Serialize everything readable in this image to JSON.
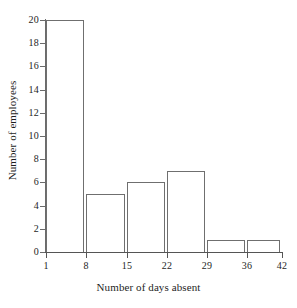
{
  "chart_data": {
    "type": "bar",
    "title": "",
    "subtitle": "",
    "xlabel": "Number of days absent",
    "ylabel": "Number of employees",
    "categories": [
      "1-8",
      "8-15",
      "15-22",
      "22-29",
      "29-36",
      "36-42"
    ],
    "bin_edges": [
      1,
      8,
      15,
      22,
      29,
      36,
      42
    ],
    "values": [
      20,
      5,
      6,
      7,
      1,
      1
    ],
    "xlim": [
      1,
      42
    ],
    "ylim": [
      0,
      20
    ],
    "x_tick_labels": [
      "1",
      "8",
      "15",
      "22",
      "29",
      "36",
      "42"
    ],
    "x_tick_values": [
      1,
      8,
      15,
      22,
      29,
      36,
      42
    ],
    "y_tick_labels": [
      "0",
      "2",
      "4",
      "6",
      "8",
      "10",
      "12",
      "14",
      "16",
      "18",
      "20"
    ],
    "y_tick_values": [
      0,
      2,
      4,
      6,
      8,
      10,
      12,
      14,
      16,
      18,
      20
    ],
    "grid": false,
    "legend": false,
    "legend_position": "none",
    "bar_fill_color": "#ffffff",
    "bar_edge_color": "#6f6f6f",
    "axis_color": "#555555",
    "text_color": "#1e1e1e",
    "background_color": "#ffffff"
  }
}
